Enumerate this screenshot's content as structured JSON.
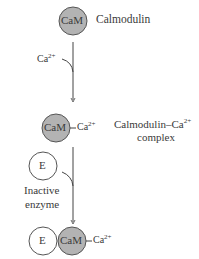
{
  "diagram": {
    "colors": {
      "cam_fill": "#b3b3b3",
      "stroke": "#555555",
      "enzyme_fill": "#ffffff",
      "text": "#3a3a3a"
    },
    "nodes": {
      "calmodulin": {
        "symbol": "CaM",
        "label": "Calmodulin"
      },
      "calcium_input": {
        "label": "Ca",
        "charge": "2+"
      },
      "complex": {
        "symbol": "CaM",
        "bound": "Ca",
        "bound_charge": "2+",
        "label_line1": "Calmodulin–Ca",
        "label_line1_charge": "2+",
        "label_line2": "complex"
      },
      "enzyme_input": {
        "symbol": "E",
        "label_line1": "Inactive",
        "label_line2": "enzyme"
      },
      "final": {
        "enzyme_symbol": "E",
        "cam_symbol": "CaM",
        "bound": "Ca",
        "bound_charge": "2+"
      }
    }
  }
}
